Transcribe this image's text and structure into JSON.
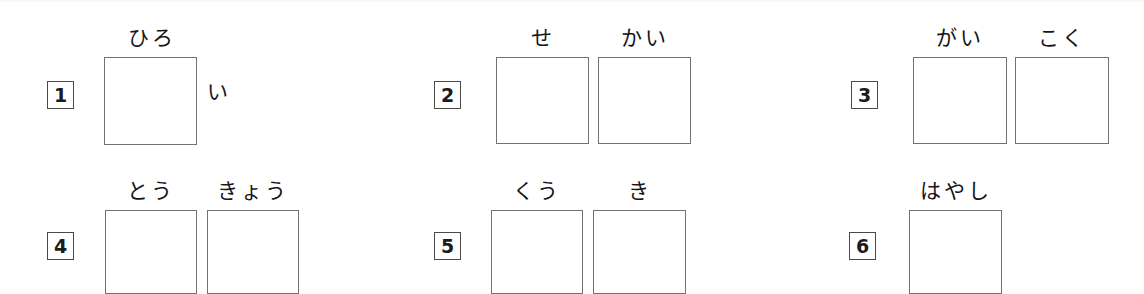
{
  "page": {
    "background_color": "#ffffff",
    "box_border_color": "#6f7276",
    "text_color": "#15151a",
    "width": 1144,
    "height": 294
  },
  "items": [
    {
      "number": "1",
      "num_x": 47,
      "num_y": 81,
      "furigana": [
        {
          "text": "ひろ",
          "x": 105,
          "y": 28,
          "width": 93
        }
      ],
      "boxes": [
        {
          "x": 104,
          "y": 57,
          "w": 93,
          "h": 88
        }
      ],
      "okurigana": [
        {
          "text": "い",
          "x": 207,
          "y": 82
        }
      ]
    },
    {
      "number": "2",
      "num_x": 434,
      "num_y": 81,
      "furigana": [
        {
          "text": "せ",
          "x": 496,
          "y": 28,
          "width": 93
        },
        {
          "text": "かい",
          "x": 598,
          "y": 28,
          "width": 93
        }
      ],
      "boxes": [
        {
          "x": 496,
          "y": 57,
          "w": 93,
          "h": 87
        },
        {
          "x": 598,
          "y": 57,
          "w": 93,
          "h": 87
        }
      ],
      "okurigana": []
    },
    {
      "number": "3",
      "num_x": 851,
      "num_y": 81,
      "furigana": [
        {
          "text": "がい",
          "x": 913,
          "y": 28,
          "width": 94
        },
        {
          "text": "こく",
          "x": 1015,
          "y": 28,
          "width": 94
        }
      ],
      "boxes": [
        {
          "x": 913,
          "y": 57,
          "w": 94,
          "h": 87
        },
        {
          "x": 1015,
          "y": 57,
          "w": 94,
          "h": 87
        }
      ],
      "okurigana": []
    },
    {
      "number": "4",
      "num_x": 47,
      "num_y": 232,
      "furigana": [
        {
          "text": "とう",
          "x": 105,
          "y": 181,
          "width": 92
        },
        {
          "text": "きょう",
          "x": 207,
          "y": 181,
          "width": 92
        }
      ],
      "boxes": [
        {
          "x": 105,
          "y": 210,
          "w": 92,
          "h": 84
        },
        {
          "x": 207,
          "y": 210,
          "w": 92,
          "h": 84
        }
      ],
      "okurigana": []
    },
    {
      "number": "5",
      "num_x": 434,
      "num_y": 232,
      "furigana": [
        {
          "text": "くう",
          "x": 491,
          "y": 181,
          "width": 92
        },
        {
          "text": "き",
          "x": 593,
          "y": 181,
          "width": 93
        }
      ],
      "boxes": [
        {
          "x": 491,
          "y": 210,
          "w": 92,
          "h": 84
        },
        {
          "x": 593,
          "y": 210,
          "w": 93,
          "h": 84
        }
      ],
      "okurigana": []
    },
    {
      "number": "6",
      "num_x": 849,
      "num_y": 232,
      "furigana": [
        {
          "text": "はやし",
          "x": 909,
          "y": 181,
          "width": 93
        }
      ],
      "boxes": [
        {
          "x": 909,
          "y": 210,
          "w": 93,
          "h": 84
        }
      ],
      "okurigana": []
    }
  ]
}
